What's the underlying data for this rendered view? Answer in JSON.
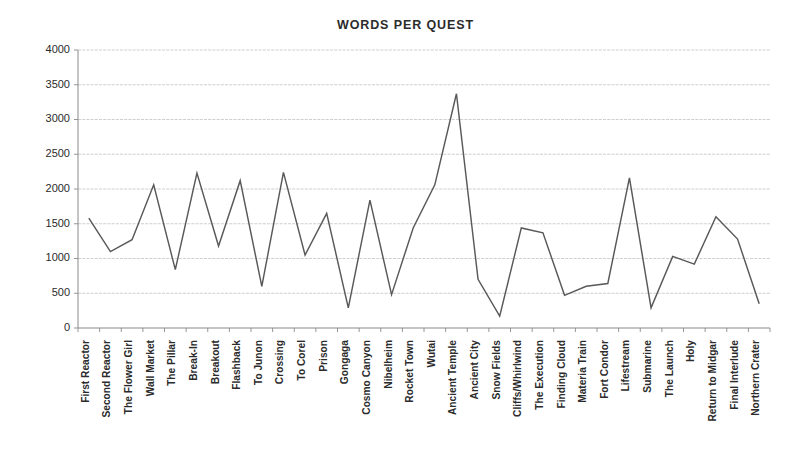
{
  "chart_data": {
    "type": "line",
    "title": "WORDS PER QUEST",
    "xlabel": "",
    "ylabel": "",
    "ylim": [
      0,
      4000
    ],
    "ytick_step": 500,
    "yticks": [
      0,
      500,
      1000,
      1500,
      2000,
      2500,
      3000,
      3500,
      4000
    ],
    "grid": true,
    "legend": "none",
    "line_color": "#595959",
    "categories": [
      "First Reactor",
      "Second Reactor",
      "The Flower Girl",
      "Wall Market",
      "The Pillar",
      "Break-In",
      "Breakout",
      "Flashback",
      "To Junon",
      "Crossing",
      "To Corel",
      "Prison",
      "Gongaga",
      "Cosmo Canyon",
      "Nibelheim",
      "Rocket Town",
      "Wutai",
      "Ancient Temple",
      "Ancient City",
      "Snow Fields",
      "Cliffs/Whirlwind",
      "The Execution",
      "Finding Cloud",
      "Materia Train",
      "Fort Condor",
      "Lifestream",
      "Submarine",
      "The Launch",
      "Holy",
      "Return to Midgar",
      "Final Interlude",
      "Northern Crater"
    ],
    "values": [
      1580,
      1100,
      1270,
      2060,
      840,
      2230,
      1180,
      2120,
      600,
      2240,
      1050,
      1650,
      290,
      1840,
      480,
      1440,
      2060,
      3370,
      700,
      170,
      1440,
      1370,
      470,
      600,
      640,
      2160,
      290,
      1030,
      920,
      1600,
      1280,
      350
    ],
    "series": [
      {
        "name": "Words per quest",
        "values": [
          1580,
          1100,
          1270,
          2060,
          840,
          2230,
          1180,
          2120,
          600,
          2240,
          1050,
          1650,
          290,
          1840,
          480,
          1440,
          2060,
          3370,
          700,
          170,
          1440,
          1370,
          470,
          600,
          640,
          2160,
          290,
          1030,
          920,
          1600,
          1280,
          350
        ]
      }
    ]
  },
  "layout": {
    "plot_left": 78,
    "plot_right": 770,
    "plot_top": 50,
    "plot_bottom": 328,
    "tick_length": 4,
    "xlabel_top_offset": 8
  }
}
